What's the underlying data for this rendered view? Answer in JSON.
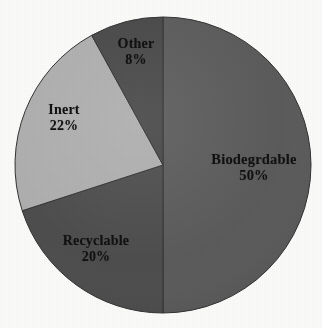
{
  "chart_data": {
    "type": "pie",
    "title": "",
    "subtitle": "",
    "xlabel": "",
    "ylabel": "",
    "legend_position": "none",
    "grid": false,
    "labels_on_slices": true,
    "unit": "%",
    "total": 100,
    "start_angle_deg": 0,
    "direction": "clockwise",
    "categories": [
      "Biodegrdable",
      "Recyclable",
      "Inert",
      "Other"
    ],
    "values": [
      50,
      20,
      22,
      8
    ],
    "slices": [
      {
        "name": "Biodegrdable",
        "value": 50,
        "value_text": "50%",
        "color": "#585858",
        "start_angle_deg": 0,
        "end_angle_deg": 180
      },
      {
        "name": "Recyclable",
        "value": 20,
        "value_text": "20%",
        "color": "#4a4a4a",
        "start_angle_deg": 180,
        "end_angle_deg": 252
      },
      {
        "name": "Inert",
        "value": 22,
        "value_text": "22%",
        "color": "#adadad",
        "start_angle_deg": 252,
        "end_angle_deg": 331.2
      },
      {
        "name": "Other",
        "value": 8,
        "value_text": "8%",
        "color": "#454545",
        "start_angle_deg": 331.2,
        "end_angle_deg": 360
      }
    ]
  },
  "labels": {
    "biodegradable": {
      "name": "Biodegrdable",
      "value": "50%"
    },
    "recyclable": {
      "name": "Recyclable",
      "value": "20%"
    },
    "inert": {
      "name": "Inert",
      "value": "22%"
    },
    "other": {
      "name": "Other",
      "value": "8%"
    }
  },
  "colors": {
    "background": "#fbfbfa",
    "label_text": "#111111",
    "slice_outline": "#2f2f2f",
    "biodegradable": "#585858",
    "recyclable": "#4a4a4a",
    "inert": "#adadad",
    "other": "#454545"
  },
  "geometry": {
    "center_x": 163,
    "center_y": 165,
    "radius": 148
  }
}
